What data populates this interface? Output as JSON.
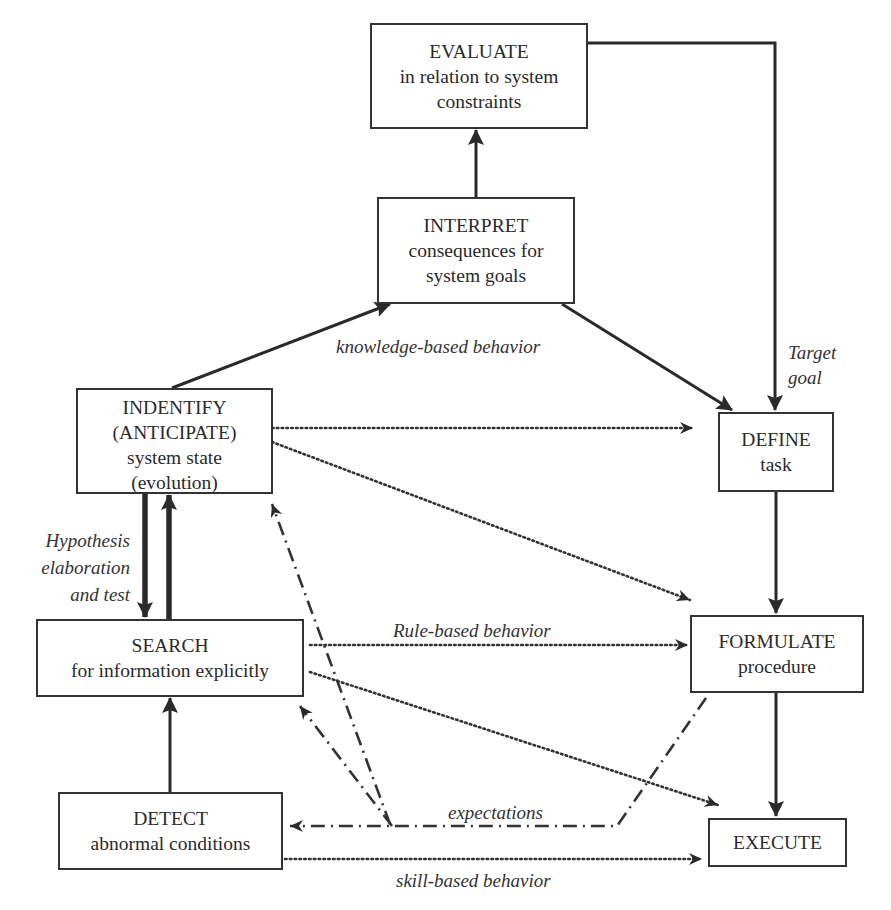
{
  "diagram": {
    "type": "flowchart",
    "colors": {
      "line": "#2a2a2a",
      "box_border": "#333333",
      "background": "#ffffff"
    },
    "boxes": {
      "evaluate": {
        "title": "EVALUATE",
        "line2": "in relation to system",
        "line3": "constraints"
      },
      "interpret": {
        "title": "INTERPRET",
        "line2": "consequences for",
        "line3": "system goals"
      },
      "identify": {
        "title": "INDENTIFY",
        "line2": "(ANTICIPATE)",
        "line3": "system state",
        "line4": "(evolution)"
      },
      "search": {
        "title": "SEARCH",
        "line2": "for information explicitly"
      },
      "detect": {
        "title": "DETECT",
        "line2": "abnormal conditions"
      },
      "define": {
        "title": "DEFINE",
        "line2": "task"
      },
      "formulate": {
        "title": "FORMULATE",
        "line2": "procedure"
      },
      "execute": {
        "title": "EXECUTE"
      }
    },
    "labels": {
      "knowledge": "knowledge-based behavior",
      "target_line1": "Target",
      "target_line2": "goal",
      "hypothesis_line1": "Hypothesis",
      "hypothesis_line2": "elaboration",
      "hypothesis_line3": "and test",
      "rule": "Rule-based behavior",
      "expectations": "expectations",
      "skill": "skill-based behavior"
    },
    "connections": [
      {
        "from": "interpret",
        "to": "evaluate",
        "style": "solid"
      },
      {
        "from": "identify",
        "to": "interpret",
        "style": "solid"
      },
      {
        "from": "interpret",
        "to": "define",
        "style": "solid"
      },
      {
        "from": "evaluate",
        "to": "define",
        "style": "solid",
        "label": "Target goal"
      },
      {
        "from": "define",
        "to": "formulate",
        "style": "solid"
      },
      {
        "from": "formulate",
        "to": "execute",
        "style": "solid"
      },
      {
        "from": "identify",
        "to": "search",
        "style": "solid-thick"
      },
      {
        "from": "search",
        "to": "identify",
        "style": "solid-thick"
      },
      {
        "from": "detect",
        "to": "search",
        "style": "solid"
      },
      {
        "from": "identify",
        "to": "define",
        "style": "dotted"
      },
      {
        "from": "identify",
        "to": "formulate",
        "style": "dotted"
      },
      {
        "from": "search",
        "to": "formulate",
        "style": "dotted",
        "label": "Rule-based behavior"
      },
      {
        "from": "search",
        "to": "execute",
        "style": "dotted"
      },
      {
        "from": "detect",
        "to": "execute",
        "style": "dotted",
        "label": "skill-based behavior"
      },
      {
        "from": "formulate",
        "to": "detect",
        "style": "dash-dot",
        "label": "expectations"
      },
      {
        "from": "expectations",
        "to": "search",
        "style": "dash-dot"
      },
      {
        "from": "expectations",
        "to": "identify",
        "style": "dash-dot"
      }
    ]
  }
}
